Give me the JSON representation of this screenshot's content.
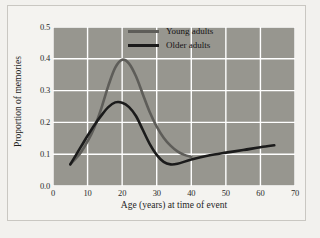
{
  "chart_data": {
    "type": "line",
    "title": "",
    "xlabel": "Age (years) at time of event",
    "ylabel": "Proportion of memories",
    "xlim": [
      0,
      70
    ],
    "ylim": [
      0.0,
      0.5
    ],
    "xticks": [
      "0",
      "10",
      "20",
      "30",
      "40",
      "50",
      "60",
      "70"
    ],
    "xtick_values": [
      0,
      10,
      20,
      30,
      40,
      50,
      60,
      70
    ],
    "yticks": [
      "0.0",
      "0.1",
      "0.2",
      "0.3",
      "0.4",
      "0.5"
    ],
    "ytick_values": [
      0.0,
      0.1,
      0.2,
      0.3,
      0.4,
      0.5
    ],
    "grid": true,
    "legend_position": "top-right",
    "plot_background": "#97968f",
    "grid_color": "#ffffff",
    "series": [
      {
        "name": "Young adults",
        "color": "#5e5d59",
        "x": [
          5,
          8,
          10,
          12,
          14,
          16,
          18,
          20,
          22,
          24,
          26,
          28,
          30,
          32,
          34,
          36,
          38,
          40
        ],
        "y": [
          0.068,
          0.105,
          0.14,
          0.185,
          0.245,
          0.315,
          0.372,
          0.397,
          0.385,
          0.345,
          0.288,
          0.232,
          0.187,
          0.152,
          0.127,
          0.109,
          0.098,
          0.092
        ]
      },
      {
        "name": "Older adults",
        "color": "#1b1b1b",
        "x": [
          5,
          8,
          10,
          12,
          14,
          16,
          18,
          20,
          22,
          24,
          26,
          28,
          30,
          32,
          34,
          36,
          40,
          45,
          50,
          55,
          60,
          64
        ],
        "y": [
          0.068,
          0.122,
          0.158,
          0.192,
          0.222,
          0.248,
          0.263,
          0.262,
          0.248,
          0.22,
          0.176,
          0.132,
          0.098,
          0.076,
          0.068,
          0.07,
          0.083,
          0.096,
          0.105,
          0.113,
          0.122,
          0.128
        ]
      }
    ]
  },
  "legend": {
    "items": [
      {
        "label": "Young adults",
        "color": "#5e5d59"
      },
      {
        "label": "Older adults",
        "color": "#1b1b1b"
      }
    ]
  }
}
